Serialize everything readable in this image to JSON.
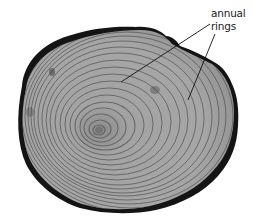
{
  "figure": {
    "label": {
      "line1": "annual",
      "line2": "rings"
    },
    "colors": {
      "bark": "#141414",
      "wood_light": "#a9a9a9",
      "wood_dark": "#5a5a5a",
      "pith": "#6e6e6e",
      "background": "#ffffff",
      "leader": "#111111"
    }
  }
}
